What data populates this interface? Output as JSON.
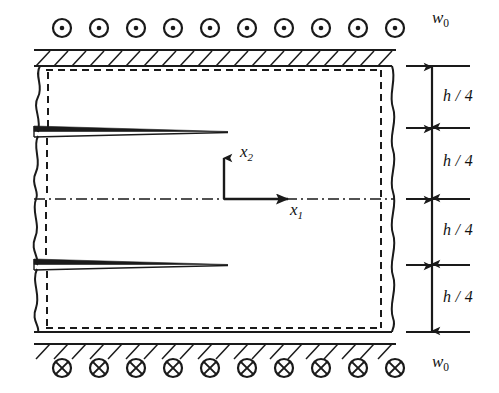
{
  "figure": {
    "type": "engineering-schematic"
  },
  "labels": {
    "load_top": {
      "symbol": "w",
      "subscript": "0",
      "text": "w0"
    },
    "load_bottom": {
      "symbol": "w",
      "subscript": "0",
      "text": "w0"
    },
    "axis_horizontal": {
      "symbol": "x",
      "subscript": "1",
      "text": "x1"
    },
    "axis_vertical": {
      "symbol": "x",
      "subscript": "2",
      "text": "x2"
    },
    "dimensions": [
      {
        "id": "dim-1",
        "text": "h / 4",
        "symbol": "h",
        "divider": "/",
        "value": "4"
      },
      {
        "id": "dim-2",
        "text": "h / 4",
        "symbol": "h",
        "divider": "/",
        "value": "4"
      },
      {
        "id": "dim-3",
        "text": "h / 4",
        "symbol": "h",
        "divider": "/",
        "value": "4"
      },
      {
        "id": "dim-4",
        "text": "h / 4",
        "symbol": "h",
        "divider": "/",
        "value": "4"
      }
    ]
  },
  "colors": {
    "line": "#1a1a1a",
    "background": "#ffffff"
  },
  "geometry": {
    "plate": {
      "left": 34,
      "right": 392,
      "top": 66,
      "bottom": 332
    },
    "interior_dashed": {
      "left": 46,
      "right": 381,
      "top": 70,
      "bottom": 327
    },
    "centerline_y": 199,
    "tick_x_start": 406,
    "tick_x_end": 470,
    "tick_y_values": [
      66,
      128,
      199,
      265,
      332
    ],
    "arrow_x": 432,
    "crack_top": {
      "y": 132,
      "tip_x": 228,
      "root_x": 34
    },
    "crack_bottom": {
      "y": 265,
      "tip_x": 228,
      "root_x": 34
    },
    "support_top_y": 50,
    "support_bottom_y": 344,
    "hatch_count": 20
  },
  "load_markers": {
    "top": {
      "glyph": "circle-dot",
      "meaning": "out-of-plane-load-toward-viewer",
      "count": 10,
      "y": 28,
      "x_start": 62,
      "x_step": 37,
      "radius": 9
    },
    "bottom": {
      "glyph": "circle-cross",
      "meaning": "out-of-plane-load-away-from-viewer",
      "count": 10,
      "y": 368,
      "x_start": 62,
      "x_step": 37,
      "radius": 9
    }
  },
  "icon_names": {
    "load_top_marker": "circle-dot-icon",
    "load_bottom_marker": "circle-cross-icon",
    "dimension_arrow": "double-arrow-icon",
    "break_line": "wavy-break-line-icon",
    "hatch": "hatch-support-icon",
    "centerline": "dash-dot-centerline-icon",
    "crack": "crack-wedge-icon"
  }
}
